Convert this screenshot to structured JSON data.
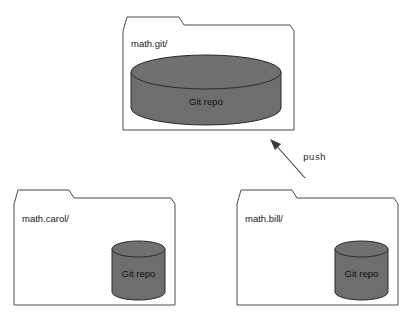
{
  "diagram": {
    "background_color": "#ffffff",
    "stroke_color": "#4a4a4a",
    "cylinder_fill": "#6e6e6e",
    "cylinder_stroke": "#2b2b2b",
    "folders": [
      {
        "id": "math-git",
        "label": "math.git/",
        "repo_label": "Git repo",
        "role": "remote-bare-repository"
      },
      {
        "id": "math-carol",
        "label": "math.carol/",
        "repo_label": "Git repo",
        "role": "working-clone"
      },
      {
        "id": "math-bill",
        "label": "math.bill/",
        "repo_label": "Git repo",
        "role": "working-clone"
      }
    ],
    "edges": [
      {
        "id": "push-edge",
        "label": "push",
        "from": "math.bill/",
        "to": "math.git/",
        "direction": "up-left",
        "arrowhead": "at-target"
      }
    ]
  }
}
